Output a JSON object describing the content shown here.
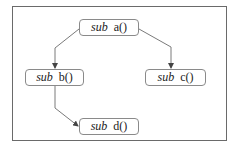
{
  "diagram": {
    "type": "call-graph",
    "nodes": [
      {
        "id": "a",
        "keyword": "sub",
        "name": "a()"
      },
      {
        "id": "b",
        "keyword": "sub",
        "name": "b()"
      },
      {
        "id": "c",
        "keyword": "sub",
        "name": "c()"
      },
      {
        "id": "d",
        "keyword": "sub",
        "name": "d()"
      }
    ],
    "edges": [
      {
        "from": "a",
        "to": "b"
      },
      {
        "from": "a",
        "to": "c"
      },
      {
        "from": "b",
        "to": "d"
      }
    ]
  },
  "colors": {
    "frame": "#6a6a6a",
    "node_border": "#8a8a8a",
    "edge": "#7a7a7a",
    "text": "#222222",
    "background": "#ffffff"
  }
}
